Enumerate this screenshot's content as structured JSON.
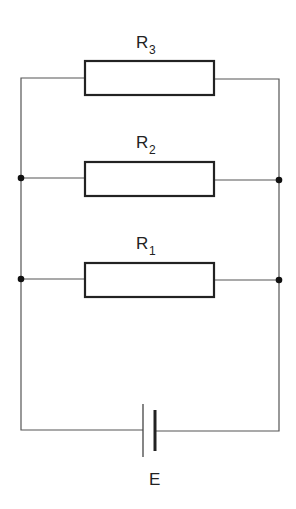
{
  "diagram": {
    "type": "circuit-schematic",
    "resistors": [
      {
        "id": "R3",
        "letter": "R",
        "subscript": "3"
      },
      {
        "id": "R2",
        "letter": "R",
        "subscript": "2"
      },
      {
        "id": "R1",
        "letter": "R",
        "subscript": "1"
      }
    ],
    "source": {
      "id": "E",
      "label": "E",
      "type": "cell/battery"
    },
    "junctions": 4,
    "connection": "parallel"
  }
}
